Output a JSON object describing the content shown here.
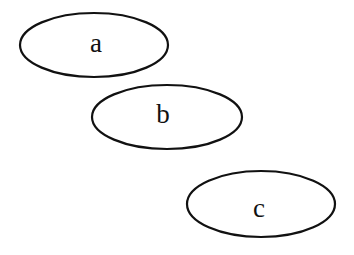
{
  "diagram": {
    "type": "ellipse-nodes",
    "stroke_color": "#111111",
    "background": "#ffffff",
    "nodes": [
      {
        "id": "a",
        "label": "a",
        "cx": 94,
        "cy": 45,
        "rx": 74,
        "ry": 32
      },
      {
        "id": "b",
        "label": "b",
        "cx": 167,
        "cy": 117,
        "rx": 75,
        "ry": 32
      },
      {
        "id": "c",
        "label": "c",
        "cx": 261,
        "cy": 204,
        "rx": 74,
        "ry": 33
      }
    ],
    "edges": []
  }
}
